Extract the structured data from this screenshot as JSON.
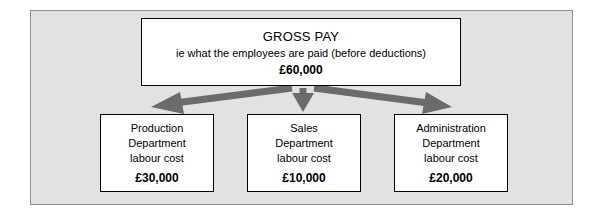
{
  "diagram": {
    "type": "flow-tree",
    "colors": {
      "panel_background": "#e2e2e2",
      "panel_border": "#8d8d8d",
      "box_background": "#ffffff",
      "box_border": "#000000",
      "arrow": "#6b6b6b",
      "text": "#000000"
    },
    "top_node": {
      "title": "GROSS PAY",
      "subtitle": "ie what the employees are paid (before deductions)",
      "amount": "£60,000"
    },
    "children": [
      {
        "line1": "Production",
        "line2": "Department",
        "line3": "labour cost",
        "amount": "£30,000"
      },
      {
        "line1": "Sales",
        "line2": "Department",
        "line3": "labour cost",
        "amount": "£10,000"
      },
      {
        "line1": "Administration",
        "line2": "Department",
        "line3": "labour cost",
        "amount": "£20,000"
      }
    ]
  }
}
